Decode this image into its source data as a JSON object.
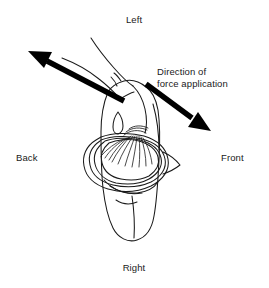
{
  "figure": {
    "type": "line-drawing",
    "background_color": "#ffffff",
    "ink_color": "#1a1a1a",
    "arrow_color": "#000000",
    "orientation_labels": {
      "top": "Left",
      "bottom": "Right",
      "left": "Back",
      "right": "Front"
    },
    "annotation": {
      "line1": "Direction of",
      "line2": "force application"
    },
    "arrows": [
      {
        "name": "upper-left-force-arrow",
        "direction": "up-left",
        "head": "solid-filled",
        "from": [
          122,
          99
        ],
        "to": [
          31,
          52
        ]
      },
      {
        "name": "lower-right-force-arrow",
        "direction": "down-right",
        "head": "solid-filled",
        "from": [
          147,
          82
        ],
        "to": [
          210,
          128
        ]
      }
    ]
  }
}
